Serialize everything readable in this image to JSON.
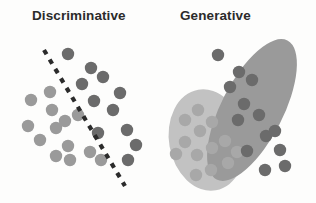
{
  "figure": {
    "width": 316,
    "height": 203,
    "background": "#fdfdfc",
    "type": "diagram"
  },
  "panels": [
    {
      "id": "discriminative",
      "title": "Discriminative",
      "title_x": 32,
      "title_y": 8,
      "decision_boundary": {
        "name": "dashed-decision-boundary",
        "style": "dashed",
        "color": "#2b2b2b",
        "stroke_width": 4.2,
        "dash_pattern": "5 6",
        "x1": 44,
        "y1": 50,
        "x2": 125,
        "y2": 186
      },
      "class_a": {
        "label": "light-class",
        "color": "#9a9a9a",
        "radius": 6.2,
        "points": [
          [
            31,
            100
          ],
          [
            50,
            92
          ],
          [
            52,
            110
          ],
          [
            28,
            126
          ],
          [
            56,
            128
          ],
          [
            65,
            121
          ],
          [
            78,
            115
          ],
          [
            40,
            140
          ],
          [
            68,
            146
          ],
          [
            56,
            156
          ],
          [
            70,
            160
          ],
          [
            90,
            152
          ],
          [
            101,
            160
          ]
        ]
      },
      "class_b": {
        "label": "dark-class",
        "color": "#6b6b6b",
        "radius": 6.2,
        "points": [
          [
            68,
            54
          ],
          [
            91,
            68
          ],
          [
            103,
            77
          ],
          [
            82,
            84
          ],
          [
            94,
            101
          ],
          [
            120,
            93
          ],
          [
            113,
            110
          ],
          [
            98,
            133
          ],
          [
            127,
            130
          ],
          [
            136,
            145
          ],
          [
            128,
            160
          ]
        ]
      }
    },
    {
      "id": "generative",
      "title": "Generative",
      "title_x": 180,
      "title_y": 8,
      "clusters": [
        {
          "name": "light-cluster-ellipse",
          "fill": "#c2c2c2",
          "cx": 207,
          "cy": 140,
          "rx": 38,
          "ry": 51,
          "rotation": -10
        },
        {
          "name": "dark-cluster-ellipse",
          "fill": "#9a9a9a",
          "cx": 252,
          "cy": 110,
          "rx": 31,
          "ry": 78,
          "rotation": 27
        }
      ],
      "class_a": {
        "label": "light-class",
        "color": "#a8a8a8",
        "radius": 6.2,
        "points": [
          [
            185,
            120
          ],
          [
            198,
            110
          ],
          [
            185,
            142
          ],
          [
            200,
            131
          ],
          [
            212,
            122
          ],
          [
            176,
            154
          ],
          [
            197,
            155
          ],
          [
            212,
            148
          ],
          [
            225,
            141
          ],
          [
            211,
            170
          ],
          [
            228,
            163
          ],
          [
            237,
            152
          ],
          [
            196,
            175
          ]
        ]
      },
      "class_b": {
        "label": "dark-class",
        "color": "#6b6b6b",
        "radius": 6.2,
        "points": [
          [
            218,
            55
          ],
          [
            239,
            72
          ],
          [
            230,
            87
          ],
          [
            252,
            80
          ],
          [
            244,
            104
          ],
          [
            259,
            115
          ],
          [
            238,
            120
          ],
          [
            266,
            136
          ],
          [
            247,
            151
          ],
          [
            275,
            131
          ],
          [
            280,
            150
          ],
          [
            285,
            166
          ],
          [
            265,
            170
          ]
        ]
      }
    }
  ],
  "chart_data": {
    "type": "scatter",
    "panels": [
      "Discriminative",
      "Generative"
    ],
    "series": [
      {
        "name": "light-class",
        "color": "#9a9a9a"
      },
      {
        "name": "dark-class",
        "color": "#6b6b6b"
      }
    ],
    "annotations": [
      "dashed decision boundary",
      "light cluster ellipse",
      "dark cluster ellipse"
    ]
  }
}
